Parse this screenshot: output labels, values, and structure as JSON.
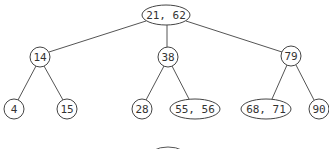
{
  "diagram": {
    "type": "tree",
    "nodes": [
      {
        "id": "root",
        "label": "21, 62",
        "shape": "ellipse",
        "cx": 166,
        "cy": 15,
        "rx": 24,
        "ry": 10
      },
      {
        "id": "n14",
        "label": "14",
        "shape": "circle",
        "cx": 40,
        "cy": 57,
        "r": 10
      },
      {
        "id": "n38",
        "label": "38",
        "shape": "circle",
        "cx": 168,
        "cy": 57,
        "r": 10
      },
      {
        "id": "n79",
        "label": "79",
        "shape": "circle",
        "cx": 291,
        "cy": 56,
        "r": 10
      },
      {
        "id": "n4",
        "label": "4",
        "shape": "circle",
        "cx": 14,
        "cy": 109,
        "r": 10
      },
      {
        "id": "n15",
        "label": "15",
        "shape": "circle",
        "cx": 67,
        "cy": 109,
        "r": 10
      },
      {
        "id": "n28",
        "label": "28",
        "shape": "circle",
        "cx": 142,
        "cy": 109,
        "r": 10
      },
      {
        "id": "n5556",
        "label": "55, 56",
        "shape": "ellipse",
        "cx": 195,
        "cy": 109,
        "rx": 25,
        "ry": 10
      },
      {
        "id": "n6871",
        "label": "68, 71",
        "shape": "ellipse",
        "cx": 266,
        "cy": 109,
        "rx": 25,
        "ry": 10
      },
      {
        "id": "n90",
        "label": "90",
        "shape": "circle",
        "cx": 319,
        "cy": 109,
        "r": 10
      }
    ],
    "edges": [
      {
        "from": "root",
        "to": "n14",
        "x1": 146,
        "y1": 21,
        "x2": 49,
        "y2": 52
      },
      {
        "from": "root",
        "to": "n38",
        "x1": 167,
        "y1": 25,
        "x2": 167,
        "y2": 47
      },
      {
        "from": "root",
        "to": "n79",
        "x1": 186,
        "y1": 21,
        "x2": 282,
        "y2": 52
      },
      {
        "from": "n14",
        "to": "n4",
        "x1": 36,
        "y1": 66,
        "x2": 18,
        "y2": 100
      },
      {
        "from": "n14",
        "to": "n15",
        "x1": 44,
        "y1": 66,
        "x2": 63,
        "y2": 100
      },
      {
        "from": "n38",
        "to": "n28",
        "x1": 164,
        "y1": 66,
        "x2": 146,
        "y2": 100
      },
      {
        "from": "n38",
        "to": "n5556",
        "x1": 172,
        "y1": 66,
        "x2": 189,
        "y2": 99
      },
      {
        "from": "n79",
        "to": "n6871",
        "x1": 287,
        "y1": 65,
        "x2": 272,
        "y2": 99
      },
      {
        "from": "n79",
        "to": "n90",
        "x1": 296,
        "y1": 65,
        "x2": 314,
        "y2": 100
      }
    ],
    "partial_shape": {
      "cx": 168,
      "cy": 158,
      "rx": 20,
      "ry": 11
    }
  }
}
